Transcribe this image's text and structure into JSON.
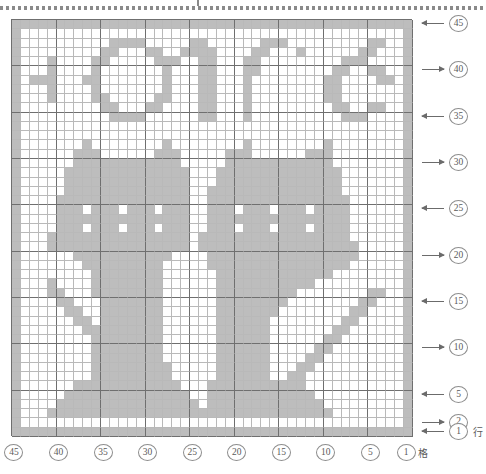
{
  "chart": {
    "type": "filet-crochet-grid",
    "title_text": "CATS",
    "columns": 45,
    "rows": 45,
    "filled_color": "#bdbdbd",
    "empty_color": "#ffffff",
    "grid_line_color": "#b9b9b9",
    "major_line_color": "#6f6f6f",
    "row_axis_unit": "行",
    "col_axis_unit": "格",
    "row_labels": [
      {
        "value": "45",
        "row": 45,
        "arrow": "left"
      },
      {
        "value": "40",
        "row": 40,
        "arrow": "right"
      },
      {
        "value": "35",
        "row": 35,
        "arrow": "left"
      },
      {
        "value": "30",
        "row": 30,
        "arrow": "right"
      },
      {
        "value": "25",
        "row": 25,
        "arrow": "left"
      },
      {
        "value": "20",
        "row": 20,
        "arrow": "right"
      },
      {
        "value": "15",
        "row": 15,
        "arrow": "left"
      },
      {
        "value": "10",
        "row": 10,
        "arrow": "right"
      },
      {
        "value": "5",
        "row": 5,
        "arrow": "left"
      },
      {
        "value": "2",
        "row": 2,
        "arrow": "right"
      },
      {
        "value": "1",
        "row": 1,
        "arrow": "left"
      }
    ],
    "col_labels": [
      {
        "value": "45",
        "col": 45
      },
      {
        "value": "40",
        "col": 40
      },
      {
        "value": "35",
        "col": 35
      },
      {
        "value": "30",
        "col": 30
      },
      {
        "value": "25",
        "col": 25
      },
      {
        "value": "20",
        "col": 20
      },
      {
        "value": "15",
        "col": 15
      },
      {
        "value": "10",
        "col": 10
      },
      {
        "value": "5",
        "col": 5
      },
      {
        "value": "1",
        "col": 1
      }
    ],
    "grid": [
      "111111111111111111111111111111111111111111111",
      "100000000000000000000000000000000000000000001",
      "100000000000001110000001110000000001000000001",
      "100000000000011000000110001000000011100000001",
      "100001000001100000000100001000011010001010001",
      "100001000001000000010001000001110011000110001",
      "100111110001000000011111000001110010000100001",
      "100001000001000000010001000001110001100010001",
      "100001000001100000010001000001110000111110001",
      "100000000000011000000000000000000000000000001",
      "100000000000001110000001110000000001000000001",
      "100000000000000000000000000000000000000000001",
      "100000001000000000010000000010000000010000001",
      "100000011100000000111000000111000000111000001",
      "100000011110000001111000001111000001111000001",
      "100000011111000011111000011111000011111000001",
      "100000011011100111011000011011100111011000001",
      "100000011111111111111000011111111111111000001",
      "100000001111111111110000001111111111110000001",
      "100000000111111111100000000111111111100000001",
      "100000000011111111000000000011111111000000001",
      "100000000001111110000000000001111110000000001",
      "100000000000111100000000000000111100000000001",
      "100000000000011000000000000000011000000000001",
      "100000000000011000000000000000011000000000001",
      "100000000000011000000000000000011000000000001",
      "100000000000011000000000000000011000000000001",
      "100000000000011000000000000000011000000000001",
      "100000000000011000000000000000011000000000001",
      "100000000000011000000000000000011000000000001",
      "100000000000011000000000000000011000000000001",
      "100000000000011000000000000000011000000000001",
      "100000000000011000000000000000011000000000001",
      "100000000000011000000000000000011000000000001",
      "100000000000011000000000000000011000000000001",
      "100000000000011000000000000000011000000000001",
      "100000000000011000000000000000011000000000001",
      "100000000000011000000000000000011000000000001",
      "100000000000011000000000000000011000000000001",
      "100000000000011000000000000000011000000000001",
      "100000000000011000000000000000011000000000001",
      "100000000000011000000000000000011000000000001",
      "100000000000011000000000000000011000000000001",
      "100000000000000000000000000000000000000000001",
      "111111111111111111111111111111111111111111111"
    ]
  }
}
